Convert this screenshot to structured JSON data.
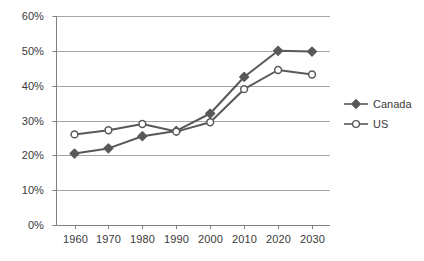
{
  "chart_data": {
    "type": "line",
    "title": "",
    "subtitle": "",
    "xlabel": "",
    "ylabel": "",
    "x": [
      1960,
      1970,
      1980,
      1990,
      2000,
      2010,
      2020,
      2030
    ],
    "categories": [
      "1960",
      "1970",
      "1980",
      "1990",
      "2000",
      "2010",
      "2020",
      "2030"
    ],
    "series": [
      {
        "name": "Canada",
        "marker": "filled-diamond",
        "color": "#595959",
        "values": [
          20.5,
          22.0,
          25.5,
          27.0,
          32.0,
          42.5,
          50.0,
          49.8
        ]
      },
      {
        "name": "US",
        "marker": "open-circle",
        "color": "#595959",
        "values": [
          26.0,
          27.2,
          29.0,
          26.8,
          29.5,
          39.0,
          44.5,
          43.2
        ]
      }
    ],
    "ylim": [
      0,
      60
    ],
    "yticks": [
      0,
      10,
      20,
      30,
      40,
      50,
      60
    ],
    "ytick_labels": [
      "0%",
      "10%",
      "20%",
      "30%",
      "40%",
      "50%",
      "60%"
    ],
    "xtick_labels": [
      "1960",
      "1970",
      "1980",
      "1990",
      "2000",
      "2010",
      "2020",
      "2030"
    ],
    "grid": "horizontal",
    "legend_position": "right",
    "legend_entries": [
      "Canada",
      "US"
    ],
    "colors": {
      "line": "#595959",
      "grid": "#a6a6a6",
      "axis": "#808080",
      "text": "#3a3a3a",
      "marker_fill_canada": "#595959",
      "marker_fill_us": "#ffffff",
      "background": "#ffffff"
    }
  }
}
